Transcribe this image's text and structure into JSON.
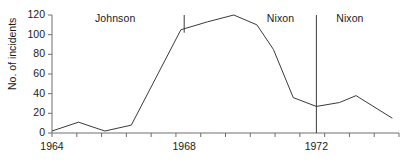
{
  "chart_data": {
    "type": "line",
    "title": "",
    "xlabel": "",
    "ylabel": "No. of incidents",
    "ylim": [
      0,
      120
    ],
    "xlim": [
      1964,
      1974.5
    ],
    "yticks": [
      0,
      20,
      40,
      60,
      80,
      100,
      120
    ],
    "ytick_labels": [
      "0",
      "20",
      "40",
      "60",
      "80",
      "100",
      "120"
    ],
    "xticks": [
      1964,
      1964.75,
      1965.5,
      1966.25,
      1967,
      1967.75,
      1968.5,
      1969.25,
      1970,
      1970.75,
      1971.5,
      1972.25,
      1973,
      1973.75,
      1974.5
    ],
    "xtick_labels": [
      {
        "value": 1964,
        "label": "1964"
      },
      {
        "value": 1968,
        "label": "1968"
      },
      {
        "value": 1972,
        "label": "1972"
      }
    ],
    "grid": false,
    "legend": false,
    "line_color": "#3a3a3a",
    "axis_color": "#6e6e6e",
    "series": [
      {
        "name": "incidents",
        "x": [
          1964.0,
          1964.8,
          1965.6,
          1966.4,
          1967.9,
          1968.7,
          1969.5,
          1970.2,
          1970.7,
          1971.3,
          1972.0,
          1972.7,
          1973.2,
          1974.3
        ],
        "values": [
          2,
          11,
          2,
          8,
          105,
          113,
          120,
          110,
          85,
          36,
          27,
          31,
          38,
          15
        ]
      }
    ],
    "annotations": [
      {
        "name": "johnson-label",
        "text": "Johnson",
        "x": 1965.3,
        "y": 116
      },
      {
        "name": "nixon-label-first",
        "text": "Nixon",
        "x": 1970.5,
        "y": 116
      },
      {
        "name": "nixon-label-second",
        "text": "Nixon",
        "x": 1972.6,
        "y": 116
      }
    ],
    "dividers": [
      {
        "name": "term-divider-1968",
        "x": 1968.0,
        "y_top": 120,
        "y_bottom": 102
      },
      {
        "name": "term-divider-1972",
        "x": 1972.0,
        "y_top": 120,
        "y_bottom": 0
      }
    ]
  }
}
